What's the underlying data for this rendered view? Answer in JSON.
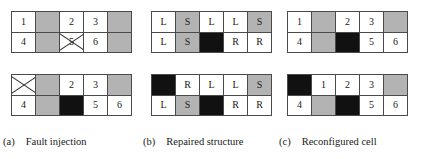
{
  "figure": {
    "colors": {
      "grid_line": "#4a4a4a",
      "cell_white": "#ffffff",
      "cell_gray": "#b3b3b3",
      "cell_black": "#111111",
      "text": "#1a1a1a",
      "background": "#ffffff"
    },
    "grid_shape": {
      "rows": 2,
      "cols": 5
    }
  },
  "panels": [
    {
      "id": "panel-a",
      "caption_tag": "(a)",
      "caption_text": "Fault injection",
      "grids": [
        {
          "id": "a-top",
          "cells": [
            {
              "label": "1",
              "fill": "white",
              "cross": false
            },
            {
              "label": "",
              "fill": "gray",
              "cross": false
            },
            {
              "label": "2",
              "fill": "white",
              "cross": false
            },
            {
              "label": "3",
              "fill": "white",
              "cross": false
            },
            {
              "label": "",
              "fill": "gray",
              "cross": false
            },
            {
              "label": "4",
              "fill": "white",
              "cross": false
            },
            {
              "label": "",
              "fill": "gray",
              "cross": false
            },
            {
              "label": "5",
              "fill": "white",
              "cross": true
            },
            {
              "label": "6",
              "fill": "white",
              "cross": false
            },
            {
              "label": "",
              "fill": "gray",
              "cross": false
            }
          ]
        },
        {
          "id": "a-bottom",
          "cells": [
            {
              "label": "",
              "fill": "white",
              "cross": true
            },
            {
              "label": "",
              "fill": "gray",
              "cross": false
            },
            {
              "label": "2",
              "fill": "white",
              "cross": false
            },
            {
              "label": "3",
              "fill": "white",
              "cross": false
            },
            {
              "label": "",
              "fill": "gray",
              "cross": false
            },
            {
              "label": "4",
              "fill": "white",
              "cross": false
            },
            {
              "label": "",
              "fill": "gray",
              "cross": false
            },
            {
              "label": "",
              "fill": "black",
              "cross": false
            },
            {
              "label": "5",
              "fill": "white",
              "cross": false
            },
            {
              "label": "6",
              "fill": "white",
              "cross": false
            }
          ]
        }
      ]
    },
    {
      "id": "panel-b",
      "caption_tag": "(b)",
      "caption_text": "Repaired structure",
      "grids": [
        {
          "id": "b-top",
          "cells": [
            {
              "label": "L",
              "fill": "white",
              "cross": false
            },
            {
              "label": "S",
              "fill": "gray",
              "cross": false
            },
            {
              "label": "L",
              "fill": "white",
              "cross": false
            },
            {
              "label": "L",
              "fill": "white",
              "cross": false
            },
            {
              "label": "S",
              "fill": "gray",
              "cross": false
            },
            {
              "label": "L",
              "fill": "white",
              "cross": false
            },
            {
              "label": "S",
              "fill": "gray",
              "cross": false
            },
            {
              "label": "",
              "fill": "black",
              "cross": false
            },
            {
              "label": "R",
              "fill": "white",
              "cross": false
            },
            {
              "label": "R",
              "fill": "white",
              "cross": false
            }
          ]
        },
        {
          "id": "b-bottom",
          "cells": [
            {
              "label": "",
              "fill": "black",
              "cross": false
            },
            {
              "label": "R",
              "fill": "white",
              "cross": false
            },
            {
              "label": "L",
              "fill": "white",
              "cross": false
            },
            {
              "label": "L",
              "fill": "white",
              "cross": false
            },
            {
              "label": "S",
              "fill": "gray",
              "cross": false
            },
            {
              "label": "L",
              "fill": "white",
              "cross": false
            },
            {
              "label": "S",
              "fill": "gray",
              "cross": false
            },
            {
              "label": "",
              "fill": "black",
              "cross": false
            },
            {
              "label": "R",
              "fill": "white",
              "cross": false
            },
            {
              "label": "R",
              "fill": "white",
              "cross": false
            }
          ]
        }
      ]
    },
    {
      "id": "panel-c",
      "caption_tag": "(c)",
      "caption_text": "Reconfigured cell",
      "grids": [
        {
          "id": "c-top",
          "cells": [
            {
              "label": "1",
              "fill": "white",
              "cross": false
            },
            {
              "label": "",
              "fill": "gray",
              "cross": false
            },
            {
              "label": "2",
              "fill": "white",
              "cross": false
            },
            {
              "label": "3",
              "fill": "white",
              "cross": false
            },
            {
              "label": "",
              "fill": "gray",
              "cross": false
            },
            {
              "label": "4",
              "fill": "white",
              "cross": false
            },
            {
              "label": "",
              "fill": "gray",
              "cross": false
            },
            {
              "label": "",
              "fill": "black",
              "cross": false
            },
            {
              "label": "5",
              "fill": "white",
              "cross": false
            },
            {
              "label": "6",
              "fill": "white",
              "cross": false
            }
          ]
        },
        {
          "id": "c-bottom",
          "cells": [
            {
              "label": "",
              "fill": "black",
              "cross": false
            },
            {
              "label": "1",
              "fill": "white",
              "cross": false
            },
            {
              "label": "2",
              "fill": "white",
              "cross": false
            },
            {
              "label": "3",
              "fill": "white",
              "cross": false
            },
            {
              "label": "",
              "fill": "gray",
              "cross": false
            },
            {
              "label": "4",
              "fill": "white",
              "cross": false
            },
            {
              "label": "",
              "fill": "gray",
              "cross": false
            },
            {
              "label": "",
              "fill": "black",
              "cross": false
            },
            {
              "label": "5",
              "fill": "white",
              "cross": false
            },
            {
              "label": "6",
              "fill": "white",
              "cross": false
            }
          ]
        }
      ]
    }
  ]
}
